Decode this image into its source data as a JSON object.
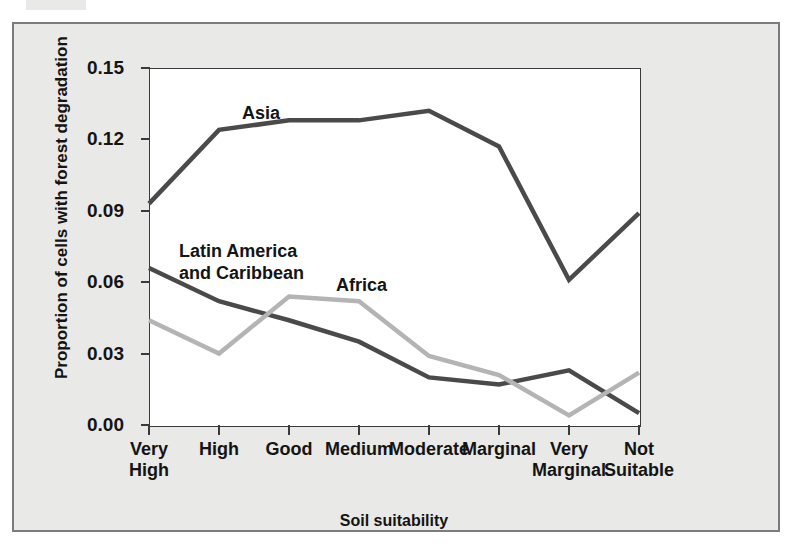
{
  "chart_data": {
    "type": "line",
    "title": "",
    "xlabel": "Soil suitability",
    "ylabel": "Proportion of cells with forest degradation",
    "categories": [
      "Very\nHigh",
      "High",
      "Good",
      "Medium",
      "Moderate",
      "Marginal",
      "Very\nMarginal",
      "Not\nSuitable"
    ],
    "ytick_labels": [
      "0.15",
      "0.12",
      "0.09",
      "0.06",
      "0.03",
      "0.00"
    ],
    "ytick_values": [
      0.15,
      0.12,
      0.09,
      0.06,
      0.03,
      0.0
    ],
    "ylim": [
      0.0,
      0.15
    ],
    "grid": false,
    "legend_position": "inline-annotations",
    "series": [
      {
        "name": "Asia",
        "color": "#4a4a4a",
        "values": [
          0.093,
          0.124,
          0.128,
          0.128,
          0.132,
          0.117,
          0.061,
          0.089
        ]
      },
      {
        "name": "Latin America\nand Caribbean",
        "color": "#4a4a4a",
        "values": [
          0.066,
          0.052,
          0.044,
          0.035,
          0.02,
          0.017,
          0.023,
          0.005
        ]
      },
      {
        "name": "Africa",
        "color": "#b4b4b4",
        "values": [
          0.044,
          0.03,
          0.054,
          0.052,
          0.029,
          0.021,
          0.004,
          0.022
        ]
      }
    ]
  },
  "axes": {
    "x_title": "Soil suitability",
    "y_title": "Proportion of cells with forest degradation"
  },
  "annotations": {
    "asia": "Asia",
    "latin_america": "Latin America\nand Caribbean",
    "africa": "Africa"
  },
  "colors": {
    "dark_series": "#4a4a4a",
    "light_series": "#b4b4b4",
    "panel_background": "#e9e9e7",
    "panel_border": "#7c7c7c",
    "plot_background": "#ffffff",
    "axis": "#3a3a3a",
    "text": "#141414"
  }
}
